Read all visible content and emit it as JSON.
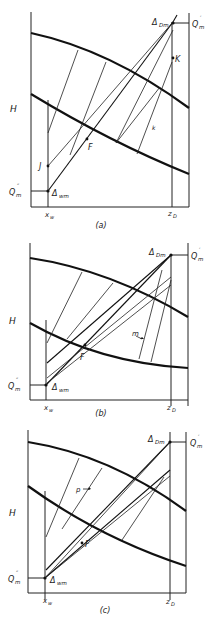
{
  "figure": {
    "panels": [
      {
        "id": "a",
        "caption": "(a)",
        "labels": {
          "y_axis": "H",
          "x_left": "x_w",
          "x_right": "z_D",
          "q_top": "Q'_m",
          "q_bottom": "Q''_m",
          "delta_top": "Δ_Dm",
          "delta_bottom": "Δ_wm",
          "points": [
            "J",
            "F",
            "K",
            "k"
          ]
        }
      },
      {
        "id": "b",
        "caption": "(b)",
        "labels": {
          "y_axis": "H",
          "x_left": "x_w",
          "x_right": "z_D",
          "q_top": "Q'_m",
          "q_bottom": "Q''_m",
          "delta_top": "Δ_Dm",
          "delta_bottom": "Δ_wm",
          "points": [
            "F",
            "m"
          ]
        }
      },
      {
        "id": "c",
        "caption": "(c)",
        "labels": {
          "y_axis": "H",
          "x_left": "x_w",
          "x_right": "z_D",
          "q_top": "Q'_m",
          "q_bottom": "Q''_m",
          "delta_top": "Δ_Dm",
          "delta_bottom": "Δ_wm",
          "points": [
            "F",
            "p"
          ]
        }
      }
    ],
    "text": {
      "H": "H",
      "Q": "Q",
      "m": "m",
      "prime": "′",
      "dprime": "″",
      "delta": "Δ",
      "Dm": "Dm",
      "wm": "wm",
      "x": "x",
      "w": "w",
      "z": "z",
      "D": "D",
      "J": "J",
      "F": "F",
      "K": "K",
      "k": "k",
      "m_label": "m",
      "p_label": "p",
      "cap_a": "(a)",
      "cap_b": "(b)",
      "cap_c": "(c)"
    }
  }
}
